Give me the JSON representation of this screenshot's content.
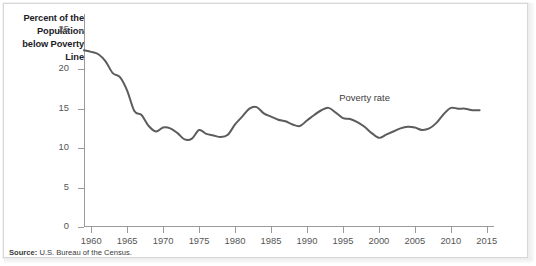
{
  "figure": {
    "source_prefix": "Source:",
    "source_text": " U.S. Bureau of the Census."
  },
  "chart_data": {
    "type": "line",
    "title": "",
    "ylabel": "Percent of the Population below Poverty Line",
    "ylabel_lines": [
      "Percent of the",
      "Population",
      "below Poverty",
      "Line"
    ],
    "xlabel": "",
    "ylim": [
      0,
      27
    ],
    "xlim": [
      1959,
      2016
    ],
    "yticks": [
      0,
      5,
      10,
      15,
      20,
      25
    ],
    "ytick_labels": [
      "0",
      "5",
      "10",
      "15",
      "20",
      "25"
    ],
    "xticks": [
      1960,
      1965,
      1970,
      1975,
      1980,
      1985,
      1990,
      1995,
      2000,
      2005,
      2010,
      2015
    ],
    "xtick_labels": [
      "1960",
      "1965",
      "1970",
      "1975",
      "1980",
      "1985",
      "1990",
      "1995",
      "2000",
      "2005",
      "2010",
      "2015"
    ],
    "grid": false,
    "legend": "none",
    "line_color": "#5c5c5c",
    "axis_color": "#9a9a9a",
    "annotations": [
      {
        "text": "Poverty rate",
        "x": 1994.5,
        "y": 16.4
      }
    ],
    "series": [
      {
        "name": "Poverty rate",
        "x": [
          1959,
          1960,
          1961,
          1962,
          1963,
          1964,
          1965,
          1966,
          1967,
          1968,
          1969,
          1970,
          1971,
          1972,
          1973,
          1974,
          1975,
          1976,
          1977,
          1978,
          1979,
          1980,
          1981,
          1982,
          1983,
          1984,
          1985,
          1986,
          1987,
          1988,
          1989,
          1990,
          1991,
          1992,
          1993,
          1994,
          1995,
          1996,
          1997,
          1998,
          1999,
          2000,
          2001,
          2002,
          2003,
          2004,
          2005,
          2006,
          2007,
          2008,
          2009,
          2010,
          2011,
          2012,
          2013,
          2014
        ],
        "values": [
          22.4,
          22.2,
          21.9,
          21.0,
          19.5,
          19.0,
          17.3,
          14.7,
          14.2,
          12.8,
          12.1,
          12.6,
          12.5,
          11.9,
          11.1,
          11.2,
          12.3,
          11.8,
          11.6,
          11.4,
          11.7,
          13.0,
          14.0,
          15.0,
          15.2,
          14.4,
          14.0,
          13.6,
          13.4,
          13.0,
          12.8,
          13.5,
          14.2,
          14.8,
          15.1,
          14.5,
          13.8,
          13.7,
          13.3,
          12.7,
          11.9,
          11.3,
          11.7,
          12.1,
          12.5,
          12.7,
          12.6,
          12.3,
          12.5,
          13.2,
          14.3,
          15.1,
          15.0,
          15.0,
          14.8,
          14.8
        ]
      }
    ]
  }
}
